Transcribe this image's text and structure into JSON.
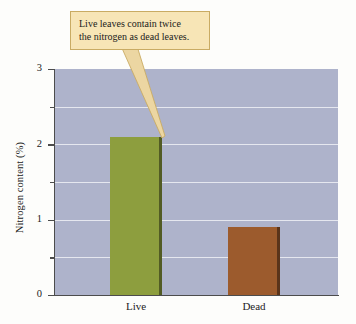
{
  "chart_data": {
    "type": "bar",
    "title": "",
    "subtitle": "",
    "xlabel": "",
    "ylabel": "Nitrogen content (%)",
    "categories": [
      "Live",
      "Dead"
    ],
    "values": [
      2.1,
      0.9
    ],
    "series": [
      {
        "name": "Nitrogen content",
        "values": [
          2.1,
          0.9
        ]
      }
    ],
    "ylim": [
      0,
      3
    ],
    "y_major_ticks": [
      0,
      1,
      2,
      3
    ],
    "y_minor_ticks": [
      0.5,
      1.5,
      2.5
    ],
    "y_tick_labels": [
      "0",
      "1",
      "2",
      "3"
    ],
    "grid": true,
    "grid_orientation": "horizontal",
    "legend": false,
    "legend_position": "none",
    "bar_colors": [
      "#8d9e3e",
      "#9c5b2d"
    ],
    "plot_background": "#aeb3cb",
    "gridline_color": "#eef0f6",
    "axis_color": "#4c4c4c",
    "annotations": [
      {
        "text": "Live leaves contain twice the nitrogen as dead leaves.",
        "line1": "Live leaves contain twice",
        "line2": "the nitrogen as dead leaves.",
        "points_to": "Live",
        "fill": "#f7e5b6",
        "border": "#c9ab63"
      }
    ]
  },
  "axis": {
    "y_title": "Nitrogen content (%)",
    "ticks": {
      "t0": "0",
      "t1": "1",
      "t2": "2",
      "t3": "3"
    }
  },
  "categories": {
    "live": "Live",
    "dead": "Dead"
  },
  "callout": {
    "line1": "Live leaves contain twice",
    "line2": "the nitrogen as dead leaves."
  }
}
